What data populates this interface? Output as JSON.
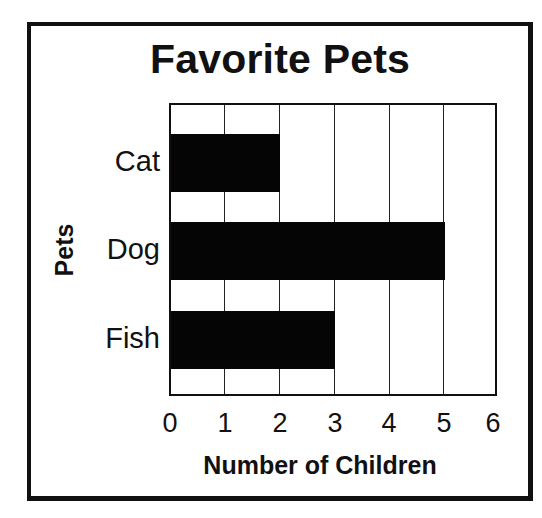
{
  "chart_data": {
    "type": "bar",
    "orientation": "horizontal",
    "title": "Favorite Pets",
    "categories": [
      "Cat",
      "Dog",
      "Fish"
    ],
    "values": [
      2,
      5,
      3
    ],
    "xlabel": "Number of Children",
    "ylabel": "Pets",
    "xlim": [
      0,
      6
    ],
    "xticks": [
      "0",
      "1",
      "2",
      "3",
      "4",
      "5",
      "6"
    ],
    "grid": true,
    "bar_color": "#050505"
  }
}
